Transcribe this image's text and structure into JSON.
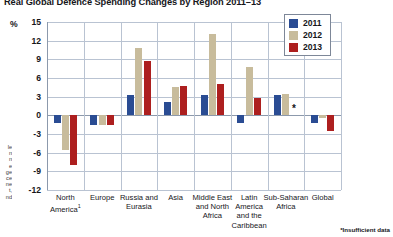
{
  "chart_data": {
    "type": "bar",
    "title": "Real Global Defence Spending Changes by Region 2011–13",
    "xlabel": "",
    "ylabel": "%",
    "ylim": [
      -12,
      15
    ],
    "yticks": [
      15,
      12,
      9,
      6,
      3,
      0,
      -3,
      -6,
      -9,
      -12
    ],
    "grid": true,
    "legend_position": "top-right",
    "categories": [
      "North America¹",
      "Europe",
      "Russia and Eurasia",
      "Asia",
      "Middle East and North Africa",
      "Latin America and the Caribbean",
      "Sub-Saharan Africa",
      "Global"
    ],
    "series": [
      {
        "name": "2011",
        "color": "#2a4c93",
        "values": [
          -1.3,
          -1.6,
          3.3,
          2.2,
          3.2,
          -1.3,
          3.2,
          -1.3
        ]
      },
      {
        "name": "2012",
        "color": "#c8bc9c",
        "values": [
          -5.5,
          -1.6,
          10.8,
          4.6,
          13.0,
          7.7,
          3.5,
          -0.5
        ]
      },
      {
        "name": "2013",
        "color": "#ad1f1f",
        "values": [
          -8.0,
          -1.6,
          8.7,
          4.7,
          5.0,
          2.8,
          null,
          -2.5
        ]
      }
    ],
    "annotations": [
      {
        "category": "Sub-Saharan Africa",
        "series": "2013",
        "marker": "*",
        "meaning": "Insufficient data"
      }
    ],
    "footnote": "*Insufficient data"
  },
  "legend": {
    "items": [
      {
        "label": "2011",
        "color": "#2a4c93"
      },
      {
        "label": "2012",
        "color": "#c8bc9c"
      },
      {
        "label": "2013",
        "color": "#ad1f1f"
      }
    ]
  },
  "axis": {
    "y_unit": "%",
    "ticks": [
      "15",
      "12",
      "9",
      "6",
      "3",
      "0",
      "-3",
      "-6",
      "-9",
      "-12"
    ]
  },
  "margin_note": "le\nn\nn\ne\nge\nce\nne\nt,\nnd"
}
